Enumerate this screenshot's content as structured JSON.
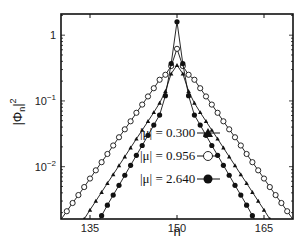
{
  "chart_data": {
    "type": "line",
    "title": "",
    "xlabel": "n",
    "ylabel": "|Φn|²",
    "yscale": "log",
    "xlim": [
      130,
      170
    ],
    "ylim": [
      0.0016,
      2.1
    ],
    "xticks": [
      135,
      150,
      165
    ],
    "xtick_labels": [
      "135",
      "150",
      "165"
    ],
    "yticks": [
      1,
      0.1,
      0.01
    ],
    "ytick_labels": [
      "1",
      "10⁻¹",
      "10⁻²"
    ],
    "grid": false,
    "legend_position": "center-bottom inside axes",
    "series": [
      {
        "name": "|μ| = 0.300",
        "marker": "triangle-filled",
        "peak_n": 150,
        "peak_value": 0.35,
        "x": [
          134,
          135,
          136,
          137,
          138,
          139,
          140,
          141,
          142,
          143,
          144,
          145,
          146,
          147,
          148,
          149,
          150,
          151,
          152,
          153,
          154,
          155,
          156,
          157,
          158,
          159,
          160,
          161,
          162,
          163,
          164,
          165,
          166
        ],
        "values": [
          0.0016,
          0.0022,
          0.003,
          0.0041,
          0.0056,
          0.0076,
          0.0104,
          0.0142,
          0.0194,
          0.0265,
          0.036,
          0.049,
          0.067,
          0.093,
          0.14,
          0.26,
          0.35,
          0.26,
          0.14,
          0.093,
          0.067,
          0.049,
          0.036,
          0.0265,
          0.0194,
          0.0142,
          0.0104,
          0.0076,
          0.0056,
          0.0041,
          0.003,
          0.0022,
          0.0016
        ]
      },
      {
        "name": "|μ| = 0.956",
        "marker": "circle-open",
        "peak_n": 150,
        "peak_value": 0.62,
        "x": [
          131,
          132,
          133,
          134,
          135,
          136,
          137,
          138,
          139,
          140,
          141,
          142,
          143,
          144,
          145,
          146,
          147,
          148,
          149,
          150,
          151,
          152,
          153,
          154,
          155,
          156,
          157,
          158,
          159,
          160,
          161,
          162,
          163,
          164,
          165,
          166,
          167,
          168,
          169
        ],
        "values": [
          0.0021,
          0.0028,
          0.0037,
          0.0049,
          0.0066,
          0.0088,
          0.0117,
          0.0156,
          0.021,
          0.028,
          0.037,
          0.049,
          0.066,
          0.088,
          0.117,
          0.156,
          0.21,
          0.25,
          0.34,
          0.62,
          0.34,
          0.25,
          0.21,
          0.156,
          0.117,
          0.088,
          0.066,
          0.049,
          0.037,
          0.028,
          0.021,
          0.0156,
          0.0117,
          0.0088,
          0.0066,
          0.0049,
          0.0037,
          0.0028,
          0.0021
        ]
      },
      {
        "name": "|μ| = 2.640",
        "marker": "circle-filled",
        "peak_n": 150,
        "peak_value": 1.6,
        "x": [
          137,
          138,
          139,
          140,
          141,
          142,
          143,
          144,
          145,
          146,
          147,
          148,
          149,
          150,
          151,
          152,
          153,
          154,
          155,
          156,
          157,
          158,
          159,
          160,
          161,
          162,
          163
        ],
        "values": [
          0.0018,
          0.0026,
          0.0037,
          0.0052,
          0.0074,
          0.0105,
          0.0149,
          0.021,
          0.03,
          0.043,
          0.061,
          0.12,
          0.37,
          1.6,
          0.37,
          0.12,
          0.061,
          0.043,
          0.03,
          0.021,
          0.0149,
          0.0105,
          0.0074,
          0.0052,
          0.0037,
          0.0026,
          0.0018
        ]
      }
    ]
  },
  "legend": {
    "items": [
      {
        "label": "|μ| = 0.300",
        "marker": "triangle-filled"
      },
      {
        "label": "|μ| = 0.956",
        "marker": "circle-open"
      },
      {
        "label": "|μ| = 2.640",
        "marker": "circle-filled"
      }
    ]
  },
  "colors": {
    "line": "#111111",
    "axis": "#111111",
    "background": "#ffffff"
  }
}
